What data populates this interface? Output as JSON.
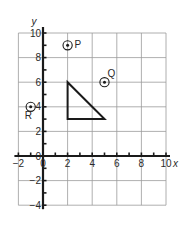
{
  "diagram": {
    "type": "coordinate-grid",
    "x_axis": {
      "label": "x",
      "min": -2,
      "max": 10,
      "tick_labels": [
        "-2",
        "0",
        "2",
        "4",
        "6",
        "8",
        "10"
      ],
      "minor_tick_step": 1,
      "grid_step": 2
    },
    "y_axis": {
      "label": "y",
      "min": -4,
      "max": 10,
      "tick_labels": [
        "-4",
        "-2",
        "0",
        "2",
        "4",
        "6",
        "8",
        "10"
      ],
      "minor_tick_step": 1,
      "grid_step": 2
    },
    "points": [
      {
        "label": "P",
        "x": 2,
        "y": 9
      },
      {
        "label": "Q",
        "x": 5,
        "y": 6
      },
      {
        "label": "R",
        "x": -1,
        "y": 4
      }
    ],
    "triangle": {
      "vertices": [
        [
          2,
          6
        ],
        [
          2,
          3
        ],
        [
          5,
          3
        ]
      ]
    },
    "colors": {
      "ink": "#1a1a1a",
      "grid": "#9a9a9a",
      "background": "#ffffff"
    }
  }
}
